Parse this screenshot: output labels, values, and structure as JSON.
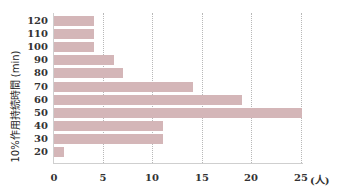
{
  "chart_data": {
    "type": "bar",
    "orientation": "horizontal",
    "title": "",
    "ylabel": "10%作用持続時間 (min)",
    "xlabel": "",
    "x_unit": "(人)",
    "categories": [
      "120",
      "110",
      "100",
      "90",
      "80",
      "70",
      "60",
      "50",
      "40",
      "30",
      "20"
    ],
    "values": [
      4,
      4,
      4,
      6,
      7,
      14,
      19,
      25,
      11,
      11,
      1
    ],
    "xlim": [
      0,
      25
    ],
    "xticks": [
      "0",
      "5",
      "10",
      "15",
      "20",
      "25"
    ],
    "grid": "vertical dotted at x ticks",
    "legend": "none",
    "bar_color": "#d4b6b8"
  }
}
